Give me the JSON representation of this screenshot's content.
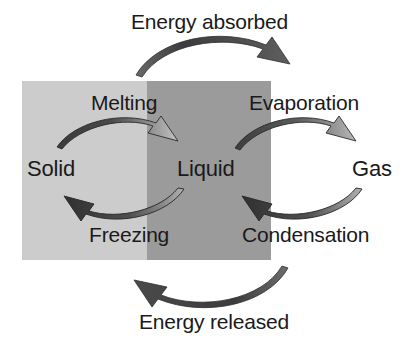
{
  "diagram": {
    "type": "cycle-diagram",
    "energy": {
      "absorbed_label": "Energy absorbed",
      "released_label": "Energy released"
    },
    "states": [
      {
        "id": "solid",
        "label": "Solid",
        "panel_color": "#cccccc"
      },
      {
        "id": "liquid",
        "label": "Liquid",
        "panel_color": "#9b9b9b"
      },
      {
        "id": "gas",
        "label": "Gas",
        "panel_color": "#ffffff"
      }
    ],
    "processes": [
      {
        "id": "melting",
        "label": "Melting",
        "from": "Solid",
        "to": "Liquid",
        "direction": "right",
        "energy": "absorbed"
      },
      {
        "id": "evaporation",
        "label": "Evaporation",
        "from": "Liquid",
        "to": "Gas",
        "direction": "right",
        "energy": "absorbed"
      },
      {
        "id": "freezing",
        "label": "Freezing",
        "from": "Liquid",
        "to": "Solid",
        "direction": "left",
        "energy": "released"
      },
      {
        "id": "condensation",
        "label": "Condensation",
        "from": "Gas",
        "to": "Liquid",
        "direction": "left",
        "energy": "released"
      }
    ],
    "arrows": [
      {
        "id": "energy-absorbed-arrow",
        "direction": "right",
        "position": "top"
      },
      {
        "id": "melting-arrow",
        "direction": "right",
        "position": "upper-left"
      },
      {
        "id": "evaporation-arrow",
        "direction": "right",
        "position": "upper-right"
      },
      {
        "id": "freezing-arrow",
        "direction": "left",
        "position": "lower-left"
      },
      {
        "id": "condensation-arrow",
        "direction": "left",
        "position": "lower-right"
      },
      {
        "id": "energy-released-arrow",
        "direction": "left",
        "position": "bottom"
      }
    ],
    "colors": {
      "text": "#1a1a1a",
      "background": "#ffffff",
      "solid_panel": "#cccccc",
      "liquid_panel": "#9b9b9b",
      "arrow_dark": "#3f3f3f",
      "arrow_light": "#b5b5b5"
    }
  }
}
